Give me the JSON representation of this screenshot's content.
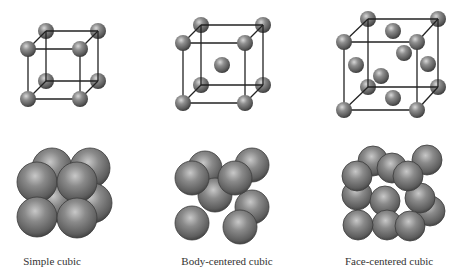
{
  "figure": {
    "background": "#ffffff",
    "sphere_color": "#6e6e6e",
    "line_color": "#222222",
    "panels": [
      {
        "id": "simple-cubic",
        "label": "Simple cubic",
        "label_x": 52,
        "cell": {
          "radius": 8,
          "corners": [
            [
              46,
              31
            ],
            [
              98,
              31
            ],
            [
              28,
              49
            ],
            [
              80,
              49
            ],
            [
              46,
              81
            ],
            [
              98,
              81
            ],
            [
              28,
              99
            ],
            [
              80,
              99
            ]
          ],
          "extra_atoms": []
        },
        "packing": {
          "radius": 20,
          "spheres": [
            [
              52,
              168
            ],
            [
              90,
              168
            ],
            [
              55,
              202
            ],
            [
              92,
              203
            ],
            [
              37,
              182
            ],
            [
              77,
              182
            ],
            [
              37,
              217
            ],
            [
              77,
              218
            ]
          ]
        }
      },
      {
        "id": "body-centered-cubic",
        "label": "Body-centered cubic",
        "label_x": 227,
        "cell": {
          "radius": 8,
          "corners": [
            [
              201,
              25
            ],
            [
              263,
              25
            ],
            [
              183,
              43
            ],
            [
              245,
              43
            ],
            [
              201,
              85
            ],
            [
              263,
              85
            ],
            [
              183,
              103
            ],
            [
              245,
              103
            ]
          ],
          "extra_atoms": [
            [
              222,
              65
            ]
          ]
        },
        "packing": {
          "radius": 17,
          "spheres": [
            [
              205,
              168
            ],
            [
              252,
              165
            ],
            [
              252,
              207
            ],
            [
              215,
              195
            ],
            [
              192,
              178
            ],
            [
              235,
              178
            ],
            [
              192,
              223
            ],
            [
              240,
              227
            ]
          ]
        }
      },
      {
        "id": "face-centered-cubic",
        "label": "Face-centered cubic",
        "label_x": 389,
        "cell": {
          "radius": 8,
          "corners": [
            [
              368,
              19
            ],
            [
              438,
              19
            ],
            [
              344,
              42
            ],
            [
              417,
              42
            ],
            [
              368,
              87
            ],
            [
              438,
              87
            ],
            [
              344,
              110
            ],
            [
              417,
              110
            ]
          ],
          "extra_atoms": [
            [
              393,
              31
            ],
            [
              404,
              53
            ],
            [
              356,
              65
            ],
            [
              428,
              64
            ],
            [
              381,
              76
            ],
            [
              393,
              98
            ]
          ]
        },
        "packing": {
          "radius": 15,
          "spheres": [
            [
              373,
              161
            ],
            [
              427,
              160
            ],
            [
              430,
              211
            ],
            [
              420,
              198
            ],
            [
              392,
              168
            ],
            [
              357,
              195
            ],
            [
              357,
              176
            ],
            [
              408,
              176
            ],
            [
              385,
              201
            ],
            [
              387,
              225
            ],
            [
              358,
              225
            ],
            [
              410,
              226
            ]
          ]
        }
      }
    ]
  }
}
